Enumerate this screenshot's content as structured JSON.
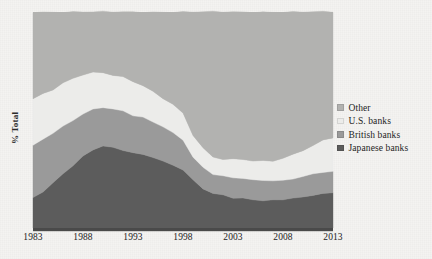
{
  "chart_data": {
    "type": "area",
    "title": "",
    "subtitle": "",
    "xlabel": "",
    "ylabel": "% Total",
    "stacked": true,
    "grid": false,
    "legend_position": "right",
    "xlim": [
      1983,
      2013
    ],
    "ylim": [
      0,
      100
    ],
    "x_tick_labels": [
      "1983",
      "1988",
      "1993",
      "1998",
      "2003",
      "2008",
      "2013"
    ],
    "x_ticks": [
      1983,
      1988,
      1993,
      1998,
      2003,
      2008,
      2013
    ],
    "y_tick_labels": [],
    "x": [
      1983,
      1984,
      1985,
      1986,
      1987,
      1988,
      1989,
      1990,
      1991,
      1992,
      1993,
      1994,
      1995,
      1996,
      1997,
      1998,
      1999,
      2000,
      2001,
      2002,
      2003,
      2004,
      2005,
      2006,
      2007,
      2008,
      2009,
      2010,
      2011,
      2012,
      2013
    ],
    "series": [
      {
        "name": "Japanese banks",
        "color": "#5c5c5c",
        "values": [
          14,
          17,
          21,
          25,
          29,
          33,
          36,
          38,
          37,
          36,
          35,
          34,
          33,
          31,
          29,
          27,
          22,
          18,
          16,
          15,
          14,
          14,
          13,
          13,
          13,
          13,
          14,
          14,
          15,
          16,
          16
        ]
      },
      {
        "name": "British banks",
        "color": "#9a9a9a",
        "values": [
          24,
          24,
          23,
          22,
          21,
          20,
          19,
          18,
          18,
          18,
          17,
          17,
          16,
          16,
          15,
          14,
          11,
          10,
          9,
          9,
          9,
          9,
          9,
          9,
          9,
          9,
          9,
          10,
          10,
          10,
          10
        ]
      },
      {
        "name": "U.S. banks",
        "color": "#ececea",
        "values": [
          22,
          21,
          20,
          20,
          19,
          18,
          17,
          16,
          16,
          16,
          16,
          15,
          14,
          13,
          13,
          12,
          10,
          9,
          8,
          8,
          9,
          9,
          9,
          9,
          9,
          10,
          11,
          12,
          13,
          15,
          16
        ]
      },
      {
        "name": "Other",
        "color": "#b2b2b0",
        "values": [
          40,
          38,
          36,
          33,
          31,
          29,
          28,
          28,
          29,
          30,
          32,
          34,
          37,
          40,
          43,
          47,
          57,
          63,
          67,
          68,
          68,
          68,
          69,
          69,
          69,
          68,
          66,
          64,
          62,
          59,
          58
        ]
      }
    ]
  },
  "legend": {
    "items": [
      {
        "label": "Other",
        "color": "#b2b2b0"
      },
      {
        "label": "U.S. banks",
        "color": "#ececea"
      },
      {
        "label": "British banks",
        "color": "#9a9a9a"
      },
      {
        "label": "Japanese banks",
        "color": "#5c5c5c"
      }
    ]
  },
  "axes": {
    "y_title": "% Total"
  },
  "colors": {
    "background": "#f4f3f1",
    "axis_line": "#4a4a4a",
    "text": "#1d1d1d"
  }
}
